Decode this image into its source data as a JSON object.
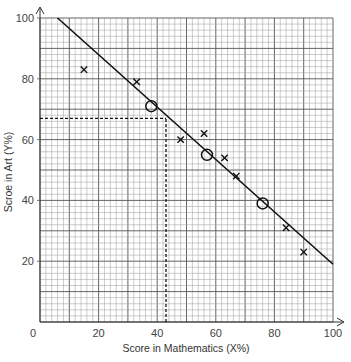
{
  "chart_data": {
    "type": "scatter",
    "title": "",
    "xlabel": "Score in Mathematics (X%)",
    "ylabel": "Scroe in Art (Y%)",
    "xlim": [
      0,
      100
    ],
    "ylim": [
      0,
      100
    ],
    "x_ticks": [
      0,
      20,
      40,
      60,
      80,
      100
    ],
    "y_ticks": [
      20,
      40,
      60,
      80,
      100
    ],
    "grid": {
      "on": true,
      "minor_step": 2,
      "major_step": 10
    },
    "series": [
      {
        "name": "data points",
        "marker": "x",
        "points": [
          {
            "x": 15,
            "y": 83
          },
          {
            "x": 33,
            "y": 79
          },
          {
            "x": 48,
            "y": 60
          },
          {
            "x": 56,
            "y": 62
          },
          {
            "x": 63,
            "y": 54
          },
          {
            "x": 67,
            "y": 48
          },
          {
            "x": 84,
            "y": 31
          },
          {
            "x": 90,
            "y": 23
          }
        ]
      },
      {
        "name": "line points",
        "marker": "circle",
        "points": [
          {
            "x": 38,
            "y": 71
          },
          {
            "x": 57,
            "y": 55
          },
          {
            "x": 76,
            "y": 39
          }
        ]
      }
    ],
    "best_fit_line": {
      "from": {
        "x": 6,
        "y": 100
      },
      "to": {
        "x": 100,
        "y": 19
      }
    },
    "reading_lines": [
      {
        "type": "horizontal",
        "y": 67,
        "x_from": 0,
        "x_to": 43,
        "style": "dashed"
      },
      {
        "type": "vertical",
        "x": 43,
        "y_from": 0,
        "y_to": 67,
        "style": "dashed"
      }
    ]
  },
  "labels": {
    "x_axis_title": "Score in Mathematics (X%)",
    "y_axis_title": "Scroe in Art (Y%)",
    "origin": "0"
  },
  "colors": {
    "grid_minor": "#9a9a9a",
    "grid_major": "#555555",
    "line": "#111111",
    "marker": "#111111",
    "text": "#444444"
  }
}
